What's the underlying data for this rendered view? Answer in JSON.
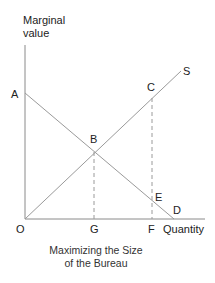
{
  "diagram": {
    "y_axis_label_line1": "Marginal",
    "y_axis_label_line2": "value",
    "x_axis_label": "Quantity",
    "caption_line1": "Maximizing the Size",
    "caption_line2": "of the Bureau",
    "points": {
      "A": "A",
      "B": "B",
      "C": "C",
      "D": "D",
      "E": "E",
      "F": "F",
      "G": "G",
      "O": "O",
      "S": "S"
    },
    "colors": {
      "line": "#9a9a9a",
      "axis": "#888888",
      "text": "#222222"
    }
  }
}
